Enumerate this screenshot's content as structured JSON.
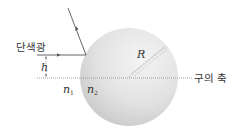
{
  "diagram": {
    "title": "",
    "labels": {
      "monochromatic_light": "단색광",
      "height": "h",
      "radius": "R",
      "sphere_axis": "구의 축",
      "n1_base": "n",
      "n1_sub": "1",
      "n2_base": "n",
      "n2_sub": "2"
    },
    "colors": {
      "line": "#555555",
      "axis_dotted": "#8a8a8a",
      "sphere_light": "#f2f2f2",
      "sphere_dark": "#cfcfcf",
      "text": "#333333"
    },
    "geometry": {
      "sphere_center": [
        129,
        77
      ],
      "sphere_radius": 49,
      "incident_ray_y": 55,
      "incident_ray_start_x": 37,
      "hit_point": [
        86,
        55
      ],
      "reflected_ray_end": [
        68,
        8
      ],
      "axis_y": 78,
      "axis_start_x": 37,
      "axis_end_x": 192
    }
  }
}
